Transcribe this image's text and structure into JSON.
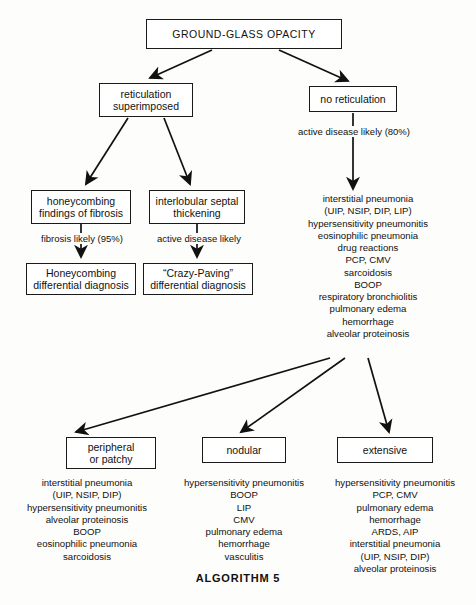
{
  "footer": {
    "title": "ALGORITHM 5"
  },
  "nodes": {
    "root": {
      "label": "GROUND-GLASS OPACITY"
    },
    "reticulation": {
      "line1": "reticulation",
      "line2": "superimposed"
    },
    "no_reticulation": {
      "label": "no reticulation"
    },
    "honeycombing": {
      "line1": "honeycombing",
      "line2": "findings of fibrosis"
    },
    "septal": {
      "line1": "interlobular septal",
      "line2": "thickening"
    },
    "honeycombing_dx": {
      "line1": "Honeycombing",
      "line2": "differential diagnosis"
    },
    "crazy_paving": {
      "line1": "“Crazy-Paving”",
      "line2": "differential diagnosis"
    },
    "peripheral": {
      "line1": "peripheral",
      "line2": "or patchy"
    },
    "nodular": {
      "label": "nodular"
    },
    "extensive": {
      "label": "extensive"
    }
  },
  "edge_labels": {
    "active_disease_80": "active disease likely (80%)",
    "fibrosis_likely_95": "fibrosis likely (95%)",
    "active_disease": "active disease likely"
  },
  "lists": {
    "main_differential": [
      "interstitial pneumonia",
      "(UIP, NSIP, DIP, LIP)",
      "hypersensitivity pneumonitis",
      "eosinophilic pneumonia",
      "drug reactions",
      "PCP, CMV",
      "sarcoidosis",
      "BOOP",
      "respiratory bronchiolitis",
      "pulmonary edema",
      "hemorrhage",
      "alveolar proteinosis"
    ],
    "peripheral_differential": [
      "interstitial pneumonia",
      "(UIP, NSIP, DIP)",
      "hypersensitivity pneumonitis",
      "alveolar proteinosis",
      "BOOP",
      "eosinophilic pneumonia",
      "sarcoidosis"
    ],
    "nodular_differential": [
      "hypersensitivity pneumonitis",
      "BOOP",
      "LIP",
      "CMV",
      "pulmonary edema",
      "hemorrhage",
      "vasculitis"
    ],
    "extensive_differential": [
      "hypersensitivity pneumonitis",
      "PCP, CMV",
      "pulmonary edema",
      "hemorrhage",
      "ARDS, AIP",
      "interstitial pneumonia",
      "(UIP, NSIP, DIP)",
      "alveolar proteinosis"
    ]
  },
  "colors": {
    "ink": "#111111",
    "border": "#1a1a1a",
    "page": "#fdfdfb"
  }
}
